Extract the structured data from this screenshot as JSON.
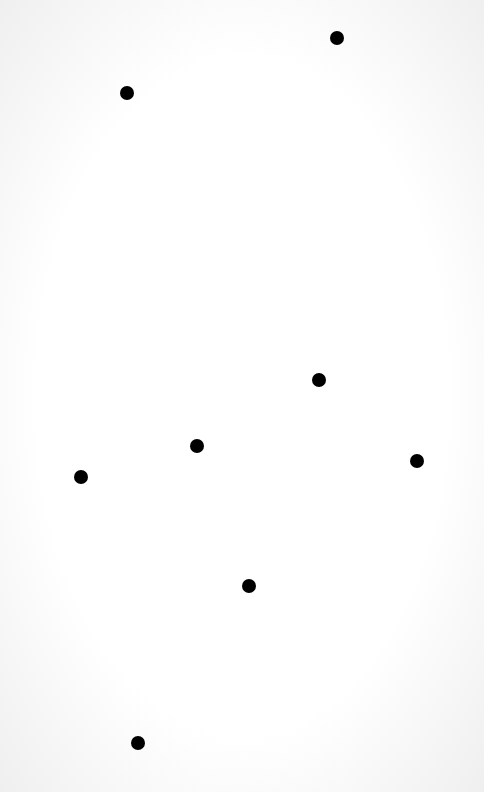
{
  "canvas": {
    "width": 484,
    "height": 792,
    "background": "#f6f6f6"
  },
  "dots": [
    {
      "x": 337,
      "y": 38
    },
    {
      "x": 127,
      "y": 93
    },
    {
      "x": 319,
      "y": 380
    },
    {
      "x": 197,
      "y": 446
    },
    {
      "x": 81,
      "y": 477
    },
    {
      "x": 417,
      "y": 461
    },
    {
      "x": 249,
      "y": 586
    },
    {
      "x": 138,
      "y": 743
    }
  ],
  "dot_color": "#000000"
}
